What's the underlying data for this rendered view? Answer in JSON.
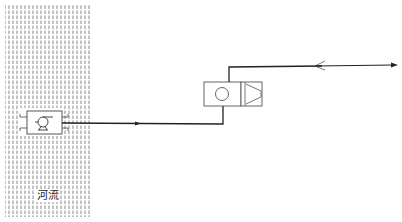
{
  "diagram": {
    "river": {
      "label": "河流",
      "hatch_color": "#555555"
    },
    "components": [
      {
        "id": "intake-pump",
        "name": "pump",
        "in": "river"
      },
      {
        "id": "treatment-unit",
        "name": "filter-unit-with-pump"
      },
      {
        "id": "check-valve",
        "name": "check-valve"
      }
    ],
    "pipes": [
      {
        "from": "intake-pump",
        "to": "treatment-unit",
        "arrow": "right"
      },
      {
        "from": "treatment-unit",
        "to": "check-valve"
      },
      {
        "from": "check-valve",
        "to": "outlet",
        "arrow": "right"
      }
    ],
    "line_color": "#222222",
    "symbol_color": "#444444"
  }
}
